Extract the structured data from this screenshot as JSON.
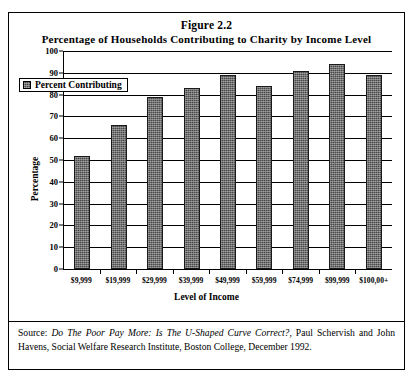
{
  "figure": {
    "number": "Figure 2.2",
    "title": "Percentage of Households Contributing to Charity by Income Level"
  },
  "legend": {
    "label": "Percent Contributing",
    "swatch_color": "#4a4a4a"
  },
  "axes": {
    "ylabel": "Percentage",
    "xlabel": "Level of Income",
    "yticks": [
      "0",
      "10",
      "20",
      "30",
      "40",
      "50",
      "60",
      "70",
      "80",
      "90",
      "100"
    ]
  },
  "source": {
    "prefix": "Source: ",
    "italic_title": "Do The Poor Pay More: Is The U-Shaped Curve Correct?",
    "rest": ", Paul Schervish and John Havens, Social Welfare Research Institute, Boston College, December 1992."
  },
  "chart_data": {
    "type": "bar",
    "title": "Percentage of Households Contributing to Charity by Income Level",
    "xlabel": "Level of Income",
    "ylabel": "Percentage",
    "ylim": [
      0,
      100
    ],
    "ytick_step": 10,
    "grid": true,
    "legend_position": "top-left-inside",
    "categories": [
      "$9,999",
      "$19,999",
      "$29,999",
      "$39,999",
      "$49,999",
      "$59,999",
      "$74,999",
      "$99,999",
      "$100,00+"
    ],
    "series": [
      {
        "name": "Percent Contributing",
        "color": "#4a4a4a",
        "values": [
          52,
          66,
          79,
          83,
          89,
          84,
          91,
          94,
          89
        ]
      }
    ]
  }
}
